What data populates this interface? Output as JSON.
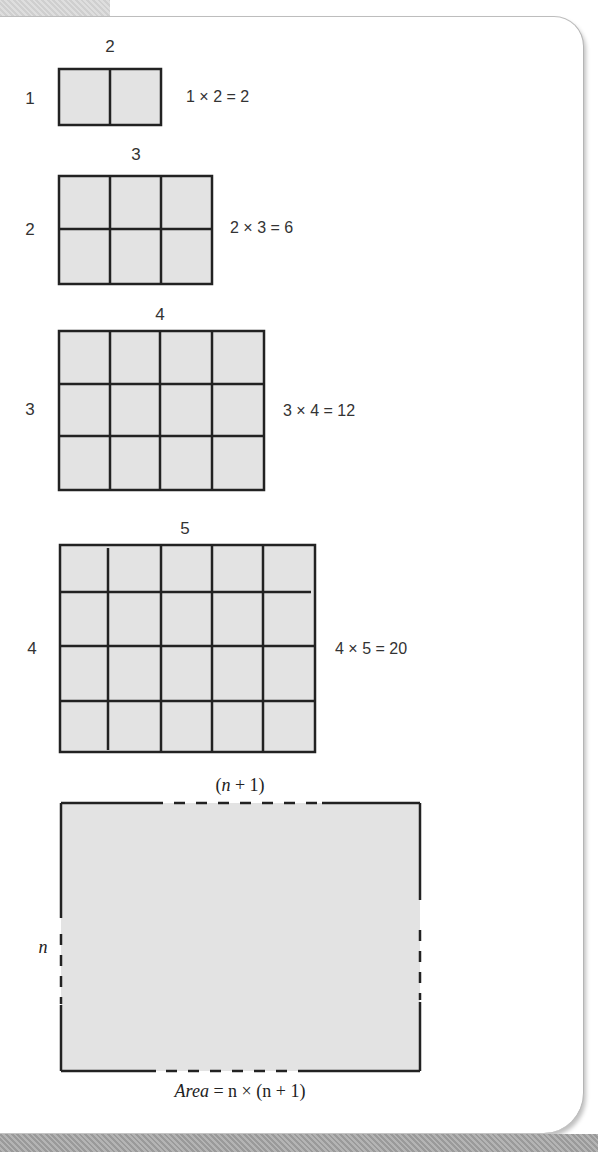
{
  "diagram": {
    "fill_color": "#e3e3e3",
    "line_color": "#222222",
    "examples": [
      {
        "rows": 1,
        "cols": 2,
        "row_label": "1",
        "col_label": "2",
        "equation": "1 × 2 = 2"
      },
      {
        "rows": 2,
        "cols": 3,
        "row_label": "2",
        "col_label": "3",
        "equation": "2 × 3 = 6"
      },
      {
        "rows": 3,
        "cols": 4,
        "row_label": "3",
        "col_label": "4",
        "equation": "3 × 4 = 12"
      },
      {
        "rows": 4,
        "cols": 5,
        "row_label": "4",
        "col_label": "5",
        "equation": "4 × 5 = 20"
      }
    ],
    "general": {
      "row_label": "n",
      "col_label": "(n + 1)",
      "area_prefix": "Area",
      "area_formula": " = n × (n + 1)"
    }
  }
}
